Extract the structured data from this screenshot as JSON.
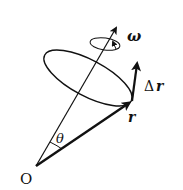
{
  "diagram": {
    "labels": {
      "origin": "O",
      "angle": "θ",
      "omega": "ω",
      "delta_r": "Δ",
      "delta_r_var": "r",
      "r": "r"
    },
    "colors": {
      "stroke": "#111111",
      "background": "#ffffff"
    }
  }
}
